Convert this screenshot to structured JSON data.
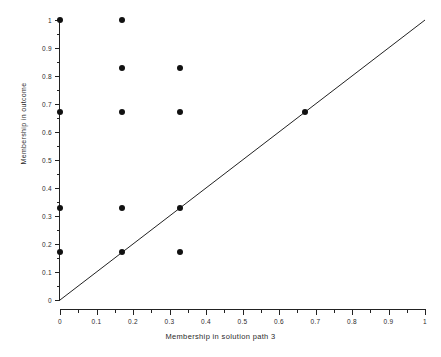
{
  "chart_data": {
    "type": "scatter",
    "title": "",
    "xlabel": "Membership in solution path 3",
    "ylabel": "Membership in outcome",
    "xlim": [
      0,
      1
    ],
    "ylim": [
      0,
      1
    ],
    "grid": false,
    "legend": "none",
    "x_ticks": [
      0,
      0.1,
      0.2,
      0.3,
      0.4,
      0.5,
      0.6,
      0.7,
      0.8,
      0.9,
      1
    ],
    "x_tick_labels": [
      "0",
      "0.1",
      "0.2",
      "0.3",
      "0.4",
      "0.5",
      "0.6",
      "0.7",
      "0.8",
      "0.9",
      "1"
    ],
    "x_minor_ticks": [
      0.05,
      0.15,
      0.25,
      0.35,
      0.45,
      0.55,
      0.65,
      0.75,
      0.85,
      0.95
    ],
    "y_ticks": [
      0,
      0.1,
      0.2,
      0.3,
      0.4,
      0.5,
      0.6,
      0.7,
      0.8,
      0.9,
      1
    ],
    "y_tick_labels": [
      "0",
      "0.1",
      "0.2",
      "0.3",
      "0.4",
      "0.5",
      "0.6",
      "0.7",
      "0.8",
      "0.9",
      "1"
    ],
    "y_minor_ticks": [
      0.05,
      0.15,
      0.25,
      0.35,
      0.45,
      0.55,
      0.65,
      0.75,
      0.85,
      0.95
    ],
    "marker": "filled-circle",
    "marker_color": "#111111",
    "marker_size_px": 6,
    "points": [
      {
        "x": 0,
        "y": 1
      },
      {
        "x": 0,
        "y": 0.67
      },
      {
        "x": 0,
        "y": 0.33
      },
      {
        "x": 0,
        "y": 0.17
      },
      {
        "x": 0.17,
        "y": 1
      },
      {
        "x": 0.17,
        "y": 0.83
      },
      {
        "x": 0.17,
        "y": 0.67
      },
      {
        "x": 0.17,
        "y": 0.33
      },
      {
        "x": 0.17,
        "y": 0.17
      },
      {
        "x": 0.33,
        "y": 0.83
      },
      {
        "x": 0.33,
        "y": 0.67
      },
      {
        "x": 0.33,
        "y": 0.33
      },
      {
        "x": 0.33,
        "y": 0.17
      },
      {
        "x": 0.67,
        "y": 0.67
      }
    ],
    "reference_line": {
      "name": "diagonal",
      "equation": "y = x",
      "from": [
        0,
        0
      ],
      "to": [
        1,
        1
      ],
      "color": "#222222",
      "width_px": 1
    }
  }
}
